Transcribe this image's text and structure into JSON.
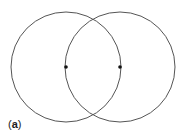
{
  "diagram": {
    "panel_label": {
      "open": "(",
      "letter": "a",
      "close": ")"
    },
    "stroke_color": "#555555",
    "point_color": "#111111",
    "circles": [
      {
        "name": "left-circle",
        "cx": 66,
        "cy": 67,
        "r": 55
      },
      {
        "name": "right-circle",
        "cx": 120,
        "cy": 67,
        "r": 55
      }
    ],
    "points": [
      {
        "name": "left-center-point",
        "cx": 66,
        "cy": 67
      },
      {
        "name": "right-center-point",
        "cx": 120,
        "cy": 67
      }
    ]
  }
}
